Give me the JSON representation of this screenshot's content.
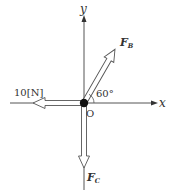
{
  "diagram": {
    "type": "force-diagram",
    "axes": {
      "x_label": "x",
      "y_label": "y",
      "origin_label": "O"
    },
    "forces": [
      {
        "id": "FA",
        "label": "10[N]",
        "direction": "left",
        "angle_deg": 180
      },
      {
        "id": "FB",
        "label_main": "F",
        "label_sub": "B",
        "direction": "up-right",
        "angle_deg": 60
      },
      {
        "id": "FC",
        "label_main": "F",
        "label_sub": "C",
        "direction": "down",
        "angle_deg": 270
      }
    ],
    "angle_annotation": "60°",
    "colors": {
      "line": "#555555",
      "dot": "#111111",
      "text": "#333333"
    }
  }
}
